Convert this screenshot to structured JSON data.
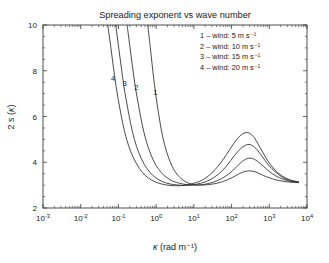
{
  "chart_data": {
    "type": "line",
    "title": "Spreading exponent vs wave number",
    "xlabel": "κ (rad m⁻¹)",
    "ylabel": "2 s(κ)",
    "xscale": "log",
    "yscale": "linear",
    "xlim": [
      0.001,
      10000
    ],
    "ylim": [
      2,
      10
    ],
    "xticks": [
      "10⁻³",
      "10⁻²",
      "10⁻¹",
      "10⁰",
      "10¹",
      "10²",
      "10³",
      "10⁴"
    ],
    "xtick_bases": [
      "10",
      "10",
      "10",
      "10",
      "10",
      "10",
      "10",
      "10"
    ],
    "xtick_exponents": [
      "-3",
      "-2",
      "-1",
      "0",
      "1",
      "2",
      "3",
      "4"
    ],
    "yticks": [
      2,
      4,
      6,
      8,
      10
    ],
    "grid": false,
    "legend_position": "top-right",
    "legend_entries": [
      "1 – wind: 5 m s⁻¹",
      "2 – wind: 10 m s⁻¹",
      "3 – wind: 15 m s⁻¹",
      "4 – wind: 20 m s⁻¹"
    ],
    "inline_labels": [
      {
        "text": "4",
        "x": 0.072,
        "y": 7.55
      },
      {
        "text": "3",
        "x": 0.145,
        "y": 7.35
      },
      {
        "text": "2",
        "x": 0.3,
        "y": 7.15
      },
      {
        "text": "1",
        "x": 0.95,
        "y": 6.95
      }
    ],
    "series": [
      {
        "name": "1 – wind: 5 m s⁻¹",
        "wind_speed": 5,
        "color": "#2b2b2b",
        "points": [
          [
            0.6,
            10.0
          ],
          [
            0.68,
            9.2
          ],
          [
            0.78,
            8.3
          ],
          [
            0.9,
            7.4
          ],
          [
            1.05,
            6.6
          ],
          [
            1.25,
            5.8
          ],
          [
            1.5,
            5.1
          ],
          [
            1.9,
            4.45
          ],
          [
            2.5,
            3.92
          ],
          [
            3.3,
            3.55
          ],
          [
            4.5,
            3.3
          ],
          [
            6.0,
            3.15
          ],
          [
            8.0,
            3.06
          ],
          [
            11.0,
            3.01
          ],
          [
            16.0,
            3.0
          ],
          [
            24.0,
            3.02
          ],
          [
            35.0,
            3.06
          ],
          [
            50.0,
            3.12
          ],
          [
            75.0,
            3.22
          ],
          [
            110.0,
            3.35
          ],
          [
            160.0,
            3.5
          ],
          [
            230.0,
            3.6
          ],
          [
            330.0,
            3.62
          ],
          [
            480.0,
            3.55
          ],
          [
            700.0,
            3.42
          ],
          [
            1000.0,
            3.32
          ],
          [
            1500.0,
            3.23
          ],
          [
            2300.0,
            3.17
          ],
          [
            3500.0,
            3.13
          ],
          [
            6000.0,
            3.11
          ]
        ]
      },
      {
        "name": "2 – wind: 10 m s⁻¹",
        "wind_speed": 10,
        "color": "#2b2b2b",
        "points": [
          [
            0.17,
            10.0
          ],
          [
            0.2,
            9.1
          ],
          [
            0.235,
            8.2
          ],
          [
            0.28,
            7.3
          ],
          [
            0.34,
            6.5
          ],
          [
            0.42,
            5.7
          ],
          [
            0.53,
            5.0
          ],
          [
            0.7,
            4.4
          ],
          [
            0.95,
            3.92
          ],
          [
            1.35,
            3.56
          ],
          [
            1.9,
            3.33
          ],
          [
            2.8,
            3.17
          ],
          [
            4.2,
            3.08
          ],
          [
            6.5,
            3.02
          ],
          [
            10.0,
            3.0
          ],
          [
            16.0,
            3.02
          ],
          [
            26.0,
            3.08
          ],
          [
            42.0,
            3.2
          ],
          [
            68.0,
            3.38
          ],
          [
            105.0,
            3.62
          ],
          [
            160.0,
            3.92
          ],
          [
            230.0,
            4.12
          ],
          [
            330.0,
            4.18
          ],
          [
            480.0,
            4.05
          ],
          [
            700.0,
            3.82
          ],
          [
            1000.0,
            3.6
          ],
          [
            1500.0,
            3.4
          ],
          [
            2300.0,
            3.26
          ],
          [
            3500.0,
            3.17
          ],
          [
            6000.0,
            3.12
          ]
        ]
      },
      {
        "name": "3 – wind: 15 m s⁻¹",
        "wind_speed": 15,
        "color": "#2b2b2b",
        "points": [
          [
            0.085,
            10.0
          ],
          [
            0.1,
            9.1
          ],
          [
            0.118,
            8.2
          ],
          [
            0.14,
            7.3
          ],
          [
            0.17,
            6.5
          ],
          [
            0.21,
            5.7
          ],
          [
            0.265,
            5.0
          ],
          [
            0.35,
            4.4
          ],
          [
            0.48,
            3.92
          ],
          [
            0.68,
            3.56
          ],
          [
            0.98,
            3.32
          ],
          [
            1.45,
            3.16
          ],
          [
            2.2,
            3.06
          ],
          [
            3.5,
            3.01
          ],
          [
            5.5,
            2.99
          ],
          [
            9.0,
            3.01
          ],
          [
            15.0,
            3.08
          ],
          [
            26.0,
            3.22
          ],
          [
            45.0,
            3.48
          ],
          [
            75.0,
            3.85
          ],
          [
            120.0,
            4.3
          ],
          [
            190.0,
            4.65
          ],
          [
            290.0,
            4.78
          ],
          [
            430.0,
            4.62
          ],
          [
            650.0,
            4.25
          ],
          [
            950.0,
            3.88
          ],
          [
            1450.0,
            3.58
          ],
          [
            2200.0,
            3.35
          ],
          [
            3500.0,
            3.2
          ],
          [
            6000.0,
            3.13
          ]
        ]
      },
      {
        "name": "4 – wind: 20 m s⁻¹",
        "wind_speed": 20,
        "color": "#8a8a8a",
        "points": [
          [
            0.052,
            10.0
          ],
          [
            0.062,
            9.1
          ],
          [
            0.073,
            8.2
          ],
          [
            0.087,
            7.3
          ],
          [
            0.105,
            6.5
          ],
          [
            0.13,
            5.7
          ],
          [
            0.165,
            5.0
          ],
          [
            0.22,
            4.4
          ],
          [
            0.305,
            3.92
          ],
          [
            0.43,
            3.56
          ],
          [
            0.62,
            3.31
          ],
          [
            0.92,
            3.15
          ],
          [
            1.4,
            3.05
          ],
          [
            2.2,
            2.99
          ],
          [
            3.6,
            2.97
          ],
          [
            6.0,
            3.0
          ],
          [
            10.0,
            3.08
          ],
          [
            18.0,
            3.25
          ],
          [
            32.0,
            3.58
          ],
          [
            56.0,
            4.05
          ],
          [
            95.0,
            4.62
          ],
          [
            155.0,
            5.1
          ],
          [
            250.0,
            5.3
          ],
          [
            380.0,
            5.12
          ],
          [
            580.0,
            4.62
          ],
          [
            880.0,
            4.1
          ],
          [
            1350.0,
            3.7
          ],
          [
            2100.0,
            3.42
          ],
          [
            3400.0,
            3.24
          ],
          [
            6000.0,
            3.14
          ]
        ]
      }
    ]
  },
  "layout": {
    "plot_left": 43,
    "plot_right": 307,
    "plot_top": 25,
    "plot_bottom": 208
  }
}
